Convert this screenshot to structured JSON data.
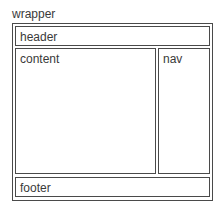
{
  "diagram": {
    "wrapper": {
      "label": "wrapper"
    },
    "header": {
      "label": "header"
    },
    "content": {
      "label": "content"
    },
    "nav": {
      "label": "nav"
    },
    "footer": {
      "label": "footer"
    }
  }
}
